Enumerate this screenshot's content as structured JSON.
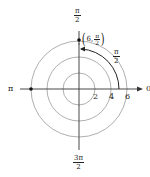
{
  "diagram": {
    "type": "polar-coordinate-plot",
    "colors": {
      "axis": "#333333",
      "circle": "#9a9a9a",
      "arc": "#222222",
      "point": "#111111",
      "text": "#222222"
    },
    "center": {
      "x": 79,
      "y": 89
    },
    "circles": [
      {
        "r_value": 2,
        "radius_px": 16
      },
      {
        "r_value": 4,
        "radius_px": 32
      },
      {
        "r_value": 6,
        "radius_px": 48
      }
    ],
    "axis_labels": {
      "top": {
        "num": "π",
        "den": "2"
      },
      "bottom": {
        "num": "3π",
        "den": "2"
      },
      "left": "π",
      "right": "0"
    },
    "radial_ticks": [
      "2",
      "4",
      "6"
    ],
    "point": {
      "label_r": "6",
      "label_theta_num": "π",
      "label_theta_den": "2",
      "comma": ","
    },
    "arc_label": {
      "num": "π",
      "den": "2"
    },
    "extra_points": [
      {
        "name": "point-pi-axis",
        "x": 31,
        "y": 89
      }
    ]
  }
}
